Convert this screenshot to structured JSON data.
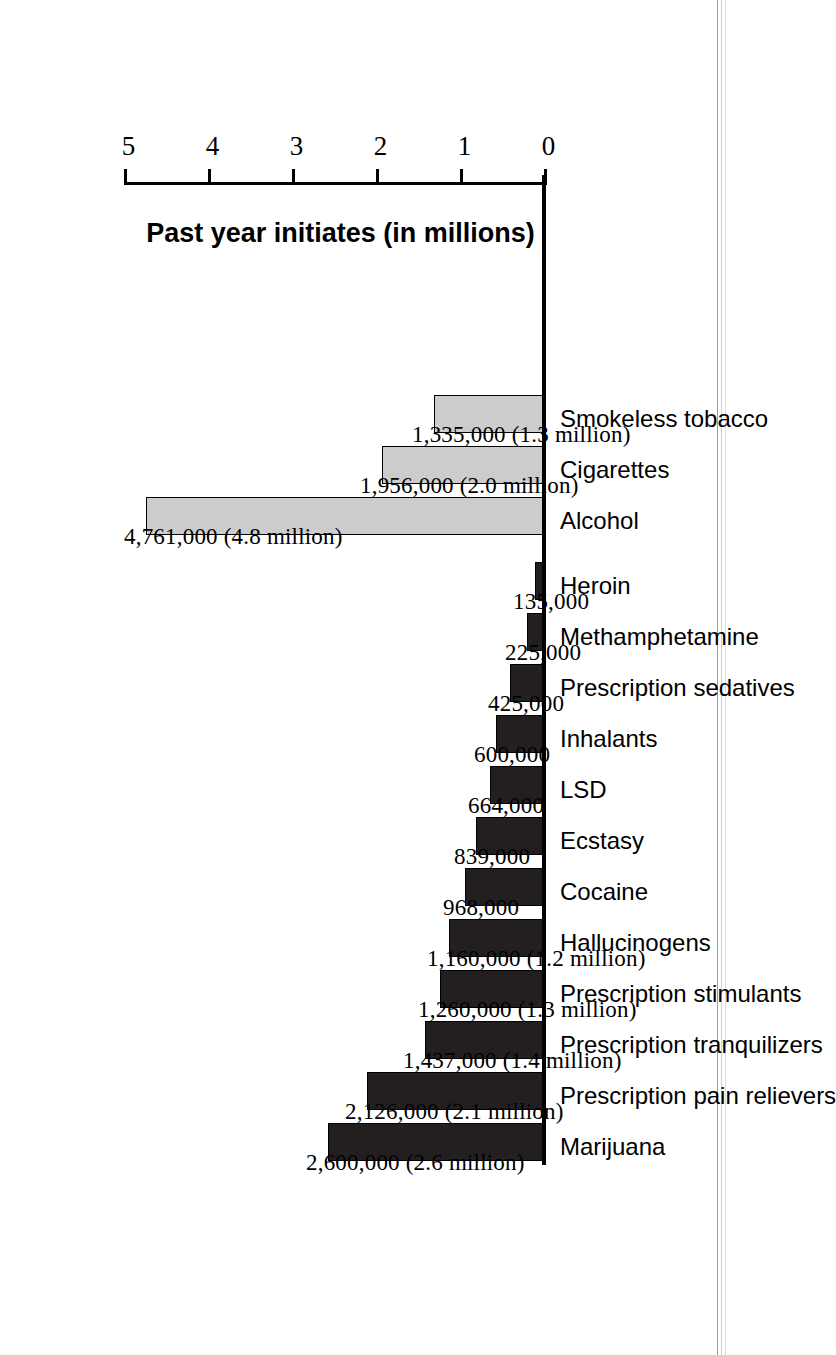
{
  "chart_data": {
    "type": "bar",
    "title": "",
    "xlabel": "",
    "ylabel": "Past year initiates (in millions)",
    "orientation": "vertical-on-rotated-page",
    "ylim": [
      0,
      5
    ],
    "yticks": [
      "0",
      "1",
      "2",
      "3",
      "4",
      "5"
    ],
    "grid": false,
    "legend": "none",
    "categories": [
      "Marijuana",
      "Prescription pain relievers",
      "Prescription tranquilizers",
      "Prescription stimulants",
      "Hallucinogens",
      "Cocaine",
      "Ecstasy",
      "LSD",
      "Inhalants",
      "Prescription sedatives",
      "Methamphetamine",
      "Heroin",
      "Alcohol",
      "Cigarettes",
      "Smokeless tobacco"
    ],
    "values": [
      2600000,
      2126000,
      1437000,
      1260000,
      1160000,
      968000,
      839000,
      664000,
      600000,
      425000,
      225000,
      135000,
      4761000,
      1956000,
      1335000
    ],
    "data_labels": [
      "2,600,000 (2.6 million)",
      "2,126,000 (2.1 million)",
      "1,437,000 (1.4 million)",
      "1,260,000 (1.3 million)",
      "1,160,000 (1.2 million)",
      "968,000",
      "839,000",
      "664,000",
      "600,000",
      "425,000",
      "225,000",
      "135,000",
      "4,761,000 (4.8 million)",
      "1,956,000 (2.0 million)",
      "1,335,000 (1.3 million)"
    ],
    "series_groups": [
      {
        "name": "illicit-drugs",
        "color": "#231f20",
        "indices": [
          0,
          1,
          2,
          3,
          4,
          5,
          6,
          7,
          8,
          9,
          10,
          11
        ]
      },
      {
        "name": "tobacco-and-alcohol",
        "color": "#cccccc",
        "indices": [
          12,
          13,
          14
        ]
      }
    ],
    "colors": {
      "dark_bar": "#231f20",
      "light_bar": "#cccccc",
      "axis": "#000000",
      "background": "#ffffff"
    }
  }
}
